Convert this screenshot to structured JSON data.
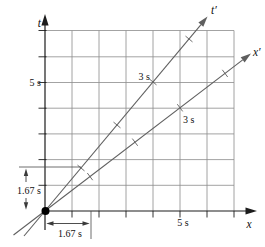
{
  "diagram": {
    "axes": {
      "t_label": "t",
      "x_label": "x",
      "t_prime_label": "t′",
      "x_prime_label": "x′"
    },
    "ticks": {
      "t_axis": "5 s",
      "x_axis": "5 s",
      "t_prime_axis": "3 s",
      "x_prime_axis": "3 s"
    },
    "dimensions": {
      "vertical": "1.67 s",
      "horizontal": "1.67 s"
    },
    "colors": {
      "background": "#ffffff",
      "grid": "#8c8c8c",
      "axis": "#1c1c1c",
      "worldline": "#5f5f5f",
      "text": "#111111"
    }
  }
}
